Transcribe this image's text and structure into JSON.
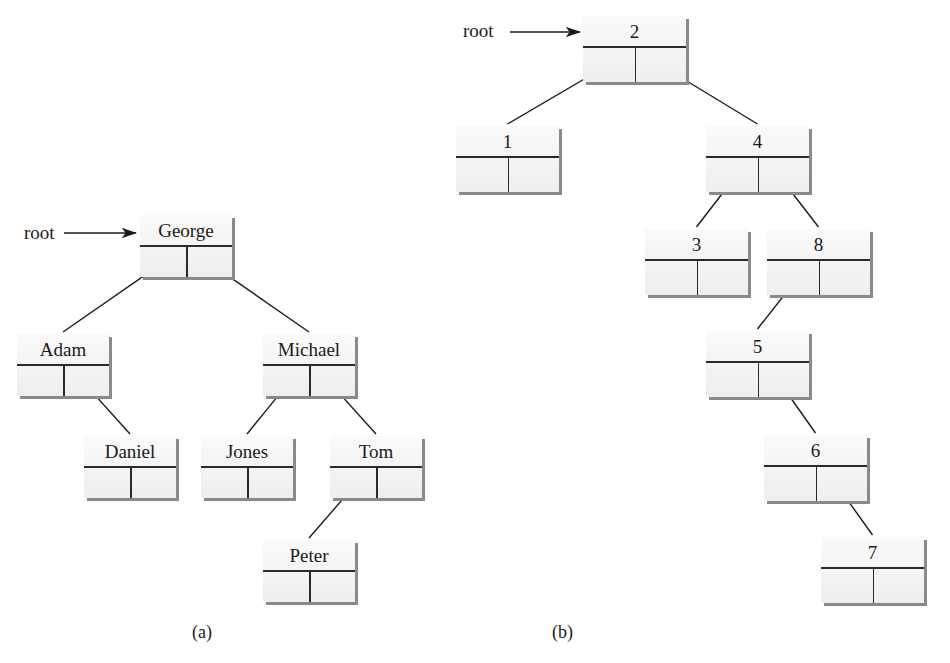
{
  "diagram": {
    "type": "binary-search-tree-figure",
    "panels": [
      {
        "id": "a",
        "caption": "(a)",
        "root_label": "root",
        "nodes": [
          {
            "id": "george",
            "value": "George",
            "x": 140,
            "y": 215,
            "w": 92,
            "h": 62
          },
          {
            "id": "adam",
            "value": "Adam",
            "x": 17,
            "y": 334,
            "w": 92,
            "h": 62
          },
          {
            "id": "michael",
            "value": "Michael",
            "x": 263,
            "y": 334,
            "w": 92,
            "h": 62
          },
          {
            "id": "daniel",
            "value": "Daniel",
            "x": 84,
            "y": 436,
            "w": 92,
            "h": 62
          },
          {
            "id": "jones",
            "value": "Jones",
            "x": 201,
            "y": 436,
            "w": 92,
            "h": 62
          },
          {
            "id": "tom",
            "value": "Tom",
            "x": 330,
            "y": 436,
            "w": 92,
            "h": 62
          },
          {
            "id": "peter",
            "value": "Peter",
            "x": 263,
            "y": 540,
            "w": 92,
            "h": 62
          }
        ],
        "edges": [
          {
            "from": "george",
            "to": "adam",
            "side": "left"
          },
          {
            "from": "george",
            "to": "michael",
            "side": "right"
          },
          {
            "from": "adam",
            "to": "daniel",
            "side": "right"
          },
          {
            "from": "michael",
            "to": "jones",
            "side": "left"
          },
          {
            "from": "michael",
            "to": "tom",
            "side": "right"
          },
          {
            "from": "tom",
            "to": "peter",
            "side": "left"
          }
        ]
      },
      {
        "id": "b",
        "caption": "(b)",
        "root_label": "root",
        "nodes": [
          {
            "id": "n2",
            "value": "2",
            "x": 583,
            "y": 16,
            "w": 103,
            "h": 66
          },
          {
            "id": "n1",
            "value": "1",
            "x": 456,
            "y": 126,
            "w": 103,
            "h": 66
          },
          {
            "id": "n4",
            "value": "4",
            "x": 706,
            "y": 126,
            "w": 103,
            "h": 66
          },
          {
            "id": "n3",
            "value": "3",
            "x": 645,
            "y": 229,
            "w": 103,
            "h": 66
          },
          {
            "id": "n8",
            "value": "8",
            "x": 767,
            "y": 229,
            "w": 103,
            "h": 66
          },
          {
            "id": "n5",
            "value": "5",
            "x": 706,
            "y": 331,
            "w": 103,
            "h": 66
          },
          {
            "id": "n6",
            "value": "6",
            "x": 764,
            "y": 435,
            "w": 103,
            "h": 66
          },
          {
            "id": "n7",
            "value": "7",
            "x": 821,
            "y": 537,
            "w": 103,
            "h": 66
          }
        ],
        "edges": [
          {
            "from": "n2",
            "to": "n1",
            "side": "left"
          },
          {
            "from": "n2",
            "to": "n4",
            "side": "right"
          },
          {
            "from": "n4",
            "to": "n3",
            "side": "left"
          },
          {
            "from": "n4",
            "to": "n8",
            "side": "right"
          },
          {
            "from": "n8",
            "to": "n5",
            "side": "left"
          },
          {
            "from": "n5",
            "to": "n6",
            "side": "right"
          },
          {
            "from": "n6",
            "to": "n7",
            "side": "right"
          }
        ]
      }
    ]
  },
  "labels": {
    "root_a": "root",
    "root_b": "root",
    "caption_a": "(a)",
    "caption_b": "(b)"
  }
}
